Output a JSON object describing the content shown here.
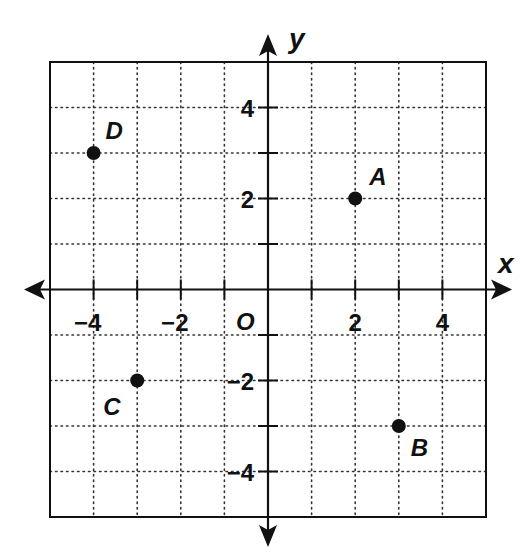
{
  "chart_data": {
    "type": "scatter",
    "title": "",
    "xlabel": "x",
    "ylabel": "y",
    "origin_label": "O",
    "xlim": [
      -5,
      5
    ],
    "ylim": [
      -5,
      5
    ],
    "grid": true,
    "grid_style": "dotted",
    "x_ticks": [
      -4,
      -3,
      -2,
      -1,
      1,
      2,
      3,
      4
    ],
    "y_ticks": [
      -4,
      -3,
      -2,
      -1,
      1,
      2,
      3,
      4
    ],
    "x_tick_labels": [
      {
        "value": -4,
        "text": "−4"
      },
      {
        "value": -2,
        "text": "−2"
      },
      {
        "value": 2,
        "text": "2"
      },
      {
        "value": 4,
        "text": "4"
      }
    ],
    "y_tick_labels": [
      {
        "value": 4,
        "text": "4"
      },
      {
        "value": 2,
        "text": "2"
      },
      {
        "value": -2,
        "text": "−2"
      },
      {
        "value": -4,
        "text": "−4"
      }
    ],
    "points": [
      {
        "label": "A",
        "x": 2,
        "y": 2,
        "label_dx": 14,
        "label_dy": -14
      },
      {
        "label": "B",
        "x": 3,
        "y": -3,
        "label_dx": 12,
        "label_dy": 30
      },
      {
        "label": "C",
        "x": -3,
        "y": -2,
        "label_dx": -34,
        "label_dy": 34
      },
      {
        "label": "D",
        "x": -4,
        "y": 3,
        "label_dx": 12,
        "label_dy": -14
      }
    ],
    "legend": null
  },
  "colors": {
    "ink": "#111111",
    "grid": "#333333",
    "background": "#ffffff"
  }
}
